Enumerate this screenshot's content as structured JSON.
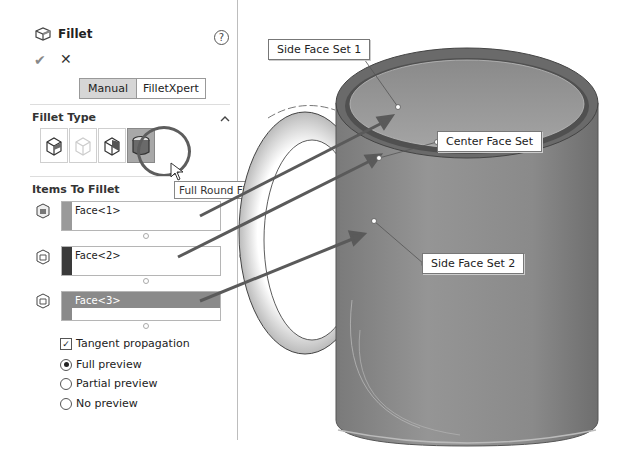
{
  "panel": {
    "title": "Fillet",
    "icons": {
      "feature": "fillet-icon",
      "help": "help-icon",
      "ok": "checkmark-icon",
      "cancel": "close-icon"
    },
    "help_label": "?",
    "ok_label": "✔",
    "cancel_label": "✕",
    "mode_tabs": [
      {
        "label": "Manual",
        "selected": true
      },
      {
        "label": "FilletXpert",
        "selected": false
      }
    ],
    "fillet_type": {
      "title": "Fillet Type",
      "collapse_label": "^",
      "types": [
        {
          "name": "constant-size-fillet",
          "selected": false
        },
        {
          "name": "variable-size-fillet",
          "selected": false
        },
        {
          "name": "face-fillet",
          "selected": false
        },
        {
          "name": "full-round-fillet",
          "selected": true
        }
      ],
      "tooltip": "Full Round Fillet"
    },
    "items_to_fillet": {
      "title": "Items To Fillet",
      "lists": [
        {
          "label": "Face<1>",
          "swatch": "#9a9a9a",
          "selected": false
        },
        {
          "label": "Face<2>",
          "swatch": "#3a3a3a",
          "selected": false
        },
        {
          "label": "Face<3>",
          "swatch": "#8a8a8a",
          "selected": true
        }
      ]
    },
    "options": {
      "tangent_propagation": {
        "label": "Tangent propagation",
        "checked": true
      },
      "preview": [
        {
          "label": "Full preview",
          "selected": true
        },
        {
          "label": "Partial preview",
          "selected": false
        },
        {
          "label": "No preview",
          "selected": false
        }
      ]
    }
  },
  "viewport": {
    "callouts": [
      {
        "label": "Side Face Set 1"
      },
      {
        "label": "Center Face Set"
      },
      {
        "label": "Side Face Set 2"
      }
    ],
    "colors": {
      "mug_body": "#8c8c8c",
      "mug_dark": "#555555",
      "arrow": "#5a5a5a"
    }
  }
}
